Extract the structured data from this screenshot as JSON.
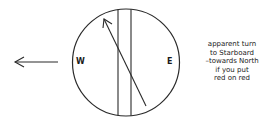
{
  "diagram": {
    "compass": {
      "west_label": "W",
      "east_label": "E"
    },
    "note_lines": [
      "apparent turn",
      "to Starboard",
      "–towards North",
      "if you put",
      "red on red"
    ],
    "colors": {
      "stroke": "#2a2a2a",
      "background": "#ffffff"
    }
  }
}
